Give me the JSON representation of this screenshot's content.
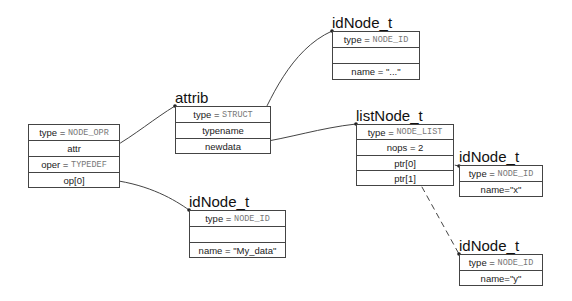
{
  "nodes": {
    "opr": {
      "title": "",
      "rows": [
        {
          "label": "type = ",
          "value": "NODE_OPR"
        },
        {
          "label": "attr",
          "value": ""
        },
        {
          "label": "oper = ",
          "value": "TYPEDEF"
        },
        {
          "label": "op[0]",
          "value": ""
        }
      ]
    },
    "attrib": {
      "title": "attrib",
      "rows": [
        {
          "label": "type = ",
          "value": "STRUCT"
        },
        {
          "label": "typename",
          "value": ""
        },
        {
          "label": "newdata",
          "value": ""
        }
      ]
    },
    "id_top": {
      "title": "idNode_t",
      "rows": [
        {
          "label": "type = ",
          "value": "NODE_ID"
        },
        {
          "label": "",
          "value": ""
        },
        {
          "label": "name = \"...\"",
          "value": ""
        }
      ]
    },
    "list": {
      "title": "listNode_t",
      "rows": [
        {
          "label": "type = ",
          "value": "NODE_LIST"
        },
        {
          "label": "nops = 2",
          "value": ""
        },
        {
          "label": "ptr[0]",
          "value": ""
        },
        {
          "label": "ptr[1]",
          "value": ""
        }
      ]
    },
    "id_mydata": {
      "title": "idNode_t",
      "rows": [
        {
          "label": "type = ",
          "value": "NODE_ID"
        },
        {
          "label": "",
          "value": ""
        },
        {
          "label": "name = \"My_data\"",
          "value": ""
        }
      ]
    },
    "id_x": {
      "title": "idNode_t",
      "rows": [
        {
          "label": "type = ",
          "value": "NODE_ID"
        },
        {
          "label": "name=\"x\"",
          "value": ""
        }
      ]
    },
    "id_y": {
      "title": "idNode_t",
      "rows": [
        {
          "label": "type = ",
          "value": "NODE_ID"
        },
        {
          "label": "name=\"y\"",
          "value": ""
        }
      ]
    }
  },
  "edges": [
    {
      "from": "opr.attr",
      "to": "attrib",
      "style": "solid"
    },
    {
      "from": "opr.op[0]",
      "to": "id_mydata",
      "style": "solid"
    },
    {
      "from": "attrib.typename",
      "to": "id_top",
      "style": "solid"
    },
    {
      "from": "attrib.newdata",
      "to": "list",
      "style": "solid"
    },
    {
      "from": "list.ptr[0]",
      "to": "id_x",
      "style": "dashed"
    },
    {
      "from": "list.ptr[1]",
      "to": "id_y",
      "style": "dashed"
    }
  ],
  "colors": {
    "line": "#444444",
    "mono_text": "#777777",
    "text": "#222222"
  }
}
